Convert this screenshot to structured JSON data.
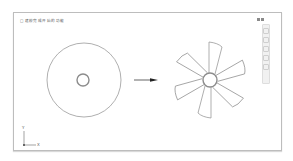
{
  "viewport": {
    "title": "□ 建模完成开 始的功能",
    "viewcube_label": "上",
    "navbar_icons": [
      "full-navigation-wheel-icon",
      "pan-icon",
      "zoom-icon",
      "orbit-icon",
      "showmotion-icon"
    ]
  },
  "axis": {
    "x_label": "X",
    "y_label": "Y"
  },
  "drawing": {
    "left_shape": "disk-with-hole",
    "arrow": "transform-arrow",
    "right_shape": "six-blade-fan",
    "blade_count": 6,
    "line_color": "#8c8c8c",
    "arrow_color": "#222222"
  }
}
